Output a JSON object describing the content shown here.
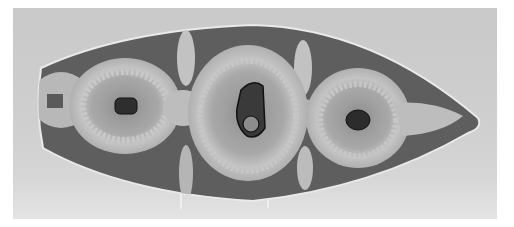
{
  "image": {
    "subject": "ceramic dish",
    "description": "Grayscale photograph of an elongated boat-shaped glazed ceramic dish with three circular motifs, standing on a wire display stand",
    "colors": {
      "background": "#cccccc",
      "glaze_dark": "#5c5c5c",
      "glaze_light": "#bdbdbd",
      "rim": "#e8e8e8",
      "motif_center": "#2a2a2a"
    },
    "motifs": [
      {
        "name": "left-roundel"
      },
      {
        "name": "center-roundel"
      },
      {
        "name": "right-roundel"
      }
    ]
  }
}
